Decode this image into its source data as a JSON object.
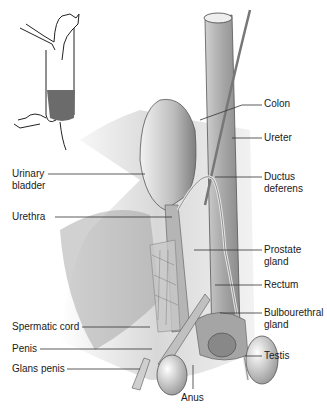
{
  "figure": {
    "inset": "Cat silhouette with highlighted pelvic region",
    "colors": {
      "inset_highlight": "#6b6b6b",
      "line": "#333333",
      "tissue_light": "#d9d9d9",
      "tissue_dark": "#7a7a7a"
    }
  },
  "labels": {
    "colon": "Colon",
    "ureter": "Ureter",
    "ductus_deferens_1": "Ductus",
    "ductus_deferens_2": "deferens",
    "urinary_bladder_1": "Urinary",
    "urinary_bladder_2": "bladder",
    "urethra": "Urethra",
    "prostate_gland_1": "Prostate",
    "prostate_gland_2": "gland",
    "rectum": "Rectum",
    "bulbourethral_gland_1": "Bulbourethral",
    "bulbourethral_gland_2": "gland",
    "spermatic_cord": "Spermatic cord",
    "penis": "Penis",
    "glans_penis": "Glans penis",
    "testis": "Testis",
    "anus": "Anus"
  }
}
